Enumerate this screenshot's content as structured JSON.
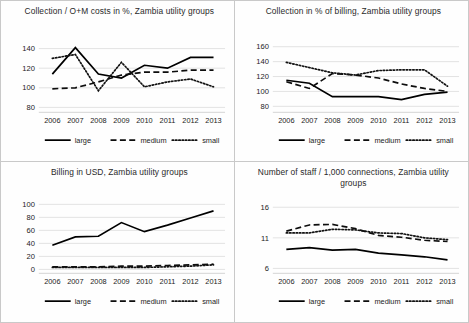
{
  "figure": {
    "layout": "2x2 grid of line charts",
    "panels_order": [
      "collection_om",
      "collection_billing",
      "billing_usd",
      "staff_per_1000"
    ]
  },
  "legend": {
    "entries": [
      {
        "label": "large",
        "style": "solid"
      },
      {
        "label": "medium",
        "style": "dashed"
      },
      {
        "label": "small",
        "style": "dotted"
      }
    ]
  },
  "chart_data": [
    {
      "id": "collection_om",
      "type": "line",
      "title": "Collection / O+M costs in %, Zambia utility groups",
      "xlabel": "",
      "ylabel": "",
      "x": [
        "2006",
        "2007",
        "2008",
        "2009",
        "2010",
        "2011",
        "2012",
        "2013"
      ],
      "ylim": [
        75,
        148
      ],
      "yticks": [
        80,
        100,
        120,
        140
      ],
      "grid": true,
      "legend_position": "bottom",
      "series": [
        {
          "name": "large",
          "style": "solid",
          "values": [
            114,
            141,
            114,
            110,
            123,
            120,
            131,
            131
          ]
        },
        {
          "name": "medium",
          "style": "dashed",
          "values": [
            99,
            100,
            106,
            113,
            116,
            116,
            118,
            118
          ]
        },
        {
          "name": "small",
          "style": "dotted",
          "values": [
            130,
            134,
            97,
            126,
            101,
            106,
            109,
            101
          ]
        }
      ]
    },
    {
      "id": "collection_billing",
      "type": "line",
      "title": "Collection in % of billing, Zambia utility groups",
      "xlabel": "",
      "ylabel": "",
      "x": [
        "2006",
        "2007",
        "2008",
        "2009",
        "2010",
        "2011",
        "2012",
        "2013"
      ],
      "ylim": [
        72,
        168
      ],
      "yticks": [
        80,
        100,
        120,
        140,
        160
      ],
      "grid": true,
      "legend_position": "bottom",
      "series": [
        {
          "name": "large",
          "style": "solid",
          "values": [
            115,
            111,
            93,
            93,
            93,
            89,
            96,
            99
          ]
        },
        {
          "name": "medium",
          "style": "dashed",
          "values": [
            113,
            104,
            124,
            122,
            118,
            110,
            104,
            100
          ]
        },
        {
          "name": "small",
          "style": "dotted",
          "values": [
            139,
            132,
            125,
            122,
            128,
            129,
            129,
            107
          ]
        }
      ]
    },
    {
      "id": "billing_usd",
      "type": "line",
      "title": "Billing in USD, Zambia utility groups",
      "xlabel": "",
      "ylabel": "",
      "x": [
        "2006",
        "2007",
        "2008",
        "2009",
        "2010",
        "2011",
        "2012",
        "2013"
      ],
      "ylim": [
        -6,
        104
      ],
      "yticks": [
        0,
        20,
        40,
        60,
        80,
        100
      ],
      "grid": true,
      "legend_position": "bottom",
      "series": [
        {
          "name": "large",
          "style": "solid",
          "values": [
            37,
            50,
            51,
            72,
            58,
            68,
            79,
            90
          ]
        },
        {
          "name": "medium",
          "style": "dashed",
          "values": [
            4,
            4,
            4,
            5,
            5,
            6,
            7,
            8
          ]
        },
        {
          "name": "small",
          "style": "dotted",
          "values": [
            3,
            3,
            3,
            3,
            3,
            4,
            5,
            7
          ]
        }
      ]
    },
    {
      "id": "staff_per_1000",
      "type": "line",
      "title": "Number of staff / 1,000 connections, Zambia utility groups",
      "xlabel": "",
      "ylabel": "",
      "x": [
        "2006",
        "2007",
        "2008",
        "2009",
        "2010",
        "2011",
        "2012",
        "2013"
      ],
      "ylim": [
        5.2,
        16.9
      ],
      "yticks": [
        6,
        11,
        16
      ],
      "grid": true,
      "legend_position": "bottom",
      "series": [
        {
          "name": "large",
          "style": "solid",
          "values": [
            9.1,
            9.4,
            9.0,
            9.1,
            8.5,
            8.2,
            7.9,
            7.4
          ]
        },
        {
          "name": "medium",
          "style": "dashed",
          "values": [
            12.1,
            13.1,
            13.2,
            12.5,
            11.4,
            11.1,
            10.6,
            10.4
          ]
        },
        {
          "name": "small",
          "style": "dotted",
          "values": [
            11.8,
            11.8,
            12.4,
            12.3,
            11.8,
            11.7,
            11.0,
            10.7
          ]
        }
      ]
    }
  ]
}
